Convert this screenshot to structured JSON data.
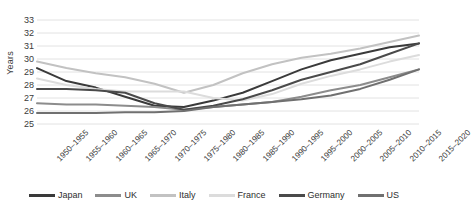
{
  "chart_data": {
    "type": "line",
    "title": "",
    "xlabel": "",
    "ylabel": "Years",
    "ylim": [
      25,
      33
    ],
    "ytick_step": 1,
    "yticks": [
      25,
      26,
      27,
      28,
      29,
      30,
      31,
      32,
      33
    ],
    "grid": true,
    "legend_position": "bottom",
    "categories": [
      "1950–1955",
      "1955–1960",
      "1960–1965",
      "1965–1970",
      "1970–1975",
      "1975–1980",
      "1980–1985",
      "1985–1990",
      "1990–1995",
      "1995–2000",
      "2000–2005",
      "2005–2010",
      "2010–2015",
      "2015–2020"
    ],
    "series": [
      {
        "name": "Japan",
        "color": "#3a3a3a",
        "values": [
          29.3,
          28.3,
          27.8,
          27.1,
          26.4,
          26.3,
          26.8,
          27.4,
          28.3,
          29.2,
          29.9,
          30.4,
          30.9,
          31.2
        ]
      },
      {
        "name": "UK",
        "color": "#8c8c8c",
        "values": [
          26.6,
          26.5,
          26.5,
          26.4,
          26.3,
          26.1,
          26.3,
          26.5,
          26.7,
          27.1,
          27.6,
          28.0,
          28.6,
          29.2
        ]
      },
      {
        "name": "Italy",
        "color": "#c2c2c2",
        "values": [
          29.8,
          29.3,
          28.9,
          28.6,
          28.1,
          27.4,
          28.0,
          28.9,
          29.6,
          30.1,
          30.4,
          30.8,
          31.3,
          31.8
        ]
      },
      {
        "name": "France",
        "color": "#dcdcdc",
        "values": [
          28.5,
          28.0,
          27.7,
          27.5,
          27.5,
          27.5,
          27.0,
          26.8,
          27.3,
          28.1,
          28.7,
          29.2,
          29.8,
          30.3
        ]
      },
      {
        "name": "Germany",
        "color": "#4a4a4a",
        "values": [
          27.7,
          27.7,
          27.6,
          27.4,
          26.6,
          26.1,
          26.4,
          26.9,
          27.6,
          28.4,
          29.0,
          29.6,
          30.4,
          31.2
        ]
      },
      {
        "name": "US",
        "color": "#707070",
        "values": [
          25.85,
          25.85,
          25.85,
          25.9,
          25.9,
          26.0,
          26.3,
          26.5,
          26.7,
          26.9,
          27.2,
          27.7,
          28.4,
          29.2
        ]
      }
    ]
  },
  "legend": {
    "items": [
      {
        "label": "Japan"
      },
      {
        "label": "UK"
      },
      {
        "label": "Italy"
      },
      {
        "label": "France"
      },
      {
        "label": "Germany"
      },
      {
        "label": "US"
      }
    ]
  },
  "axes": {
    "y_title": "Years"
  }
}
